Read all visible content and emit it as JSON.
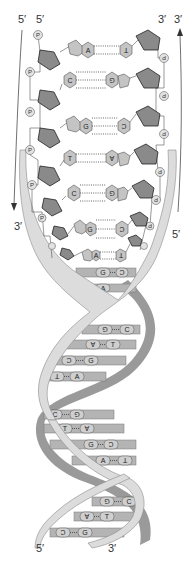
{
  "diagram": {
    "colors": {
      "ribbon_front": "#d8d8d8",
      "ribbon_back": "#9a9a9a",
      "sugar": "#8a8a8a",
      "base": "#c4c4c4",
      "phosphate": "#e2e2e2",
      "line": "#555555"
    },
    "labels": {
      "outer_left_top": "5′",
      "inner_left_top": "5′",
      "inner_right_top": "3′",
      "outer_right_top": "3′",
      "outer_left_bottom": "3′",
      "outer_right_bottom": "5′",
      "helix_bottom_left": "5′",
      "helix_bottom_right": "3′"
    },
    "phosphate_label": "P",
    "ladder_pairs": [
      {
        "left": "A",
        "right": "T",
        "bonds": 2
      },
      {
        "left": "C",
        "right": "G",
        "bonds": 3
      },
      {
        "left": "G",
        "right": "C",
        "bonds": 3
      },
      {
        "left": "T",
        "right": "A",
        "bonds": 2
      },
      {
        "left": "C",
        "right": "G",
        "bonds": 3
      },
      {
        "left": "G",
        "right": "C",
        "bonds": 3
      },
      {
        "left": "A",
        "right": "T",
        "bonds": 2
      }
    ],
    "helix_pairs": [
      {
        "left": "G",
        "right": "C"
      },
      {
        "left": "A",
        "right": "T"
      },
      {
        "left": "G",
        "right": "C"
      },
      {
        "left": "A",
        "right": "T"
      },
      {
        "left": "C",
        "right": "G"
      },
      {
        "left": "T",
        "right": "A"
      },
      {
        "left": "C",
        "right": "G"
      },
      {
        "left": "T",
        "right": "A"
      },
      {
        "left": "G",
        "right": "C"
      },
      {
        "left": "A",
        "right": "T"
      },
      {
        "left": "G",
        "right": "C"
      },
      {
        "left": "A",
        "right": "T"
      },
      {
        "left": "C",
        "right": "G"
      }
    ]
  }
}
